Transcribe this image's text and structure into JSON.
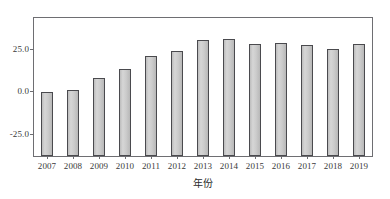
{
  "chart_data": {
    "type": "bar",
    "title": "",
    "subtitle": "",
    "xlabel": "年份",
    "ylabel": "",
    "categories": [
      "2007",
      "2008",
      "2009",
      "2010",
      "2011",
      "2012",
      "2013",
      "2014",
      "2015",
      "2016",
      "2017",
      "2018",
      "2019"
    ],
    "values": [
      -0.3,
      0.6,
      8.0,
      13.0,
      20.5,
      23.5,
      30.0,
      30.5,
      27.5,
      28.5,
      27.0,
      25.0,
      27.5
    ],
    "series": [
      {
        "name": "",
        "values": [
          -0.3,
          0.6,
          8.0,
          13.0,
          20.5,
          23.5,
          30.0,
          30.5,
          27.5,
          28.5,
          27.0,
          25.0,
          27.5
        ]
      }
    ],
    "ylim": [
      -38.0,
      43.0
    ],
    "y_ticks": [
      25.0,
      0.0,
      -25.0
    ],
    "y_tick_labels": [
      "25.0",
      "0.0",
      "-25.0"
    ],
    "grid": false,
    "legend": false,
    "legend_position": "none",
    "bar_fill_color": "#c9c9c9",
    "bar_edge_color": "#4a4a4e",
    "frame_color": "#6e6e72",
    "background_color": "#ffffff",
    "bar_baseline": -38.0,
    "note": "Bars are drawn from the bottom of the axes up to each value."
  },
  "axes": {
    "x_axis_title": "年份",
    "y_tick_labels": [
      "25.0",
      "0.0",
      "-25.0"
    ]
  }
}
